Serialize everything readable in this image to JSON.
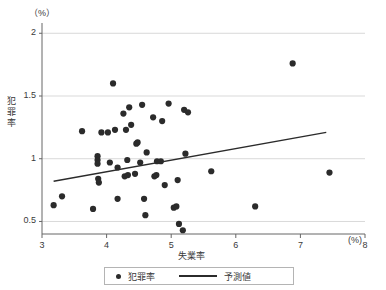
{
  "chart_data": {
    "type": "scatter",
    "title": "",
    "xlabel": "失業率",
    "ylabel": "犯罪率",
    "x_unit": "(%)",
    "y_unit": "（%）",
    "xlim": [
      3.0,
      8.0
    ],
    "ylim": [
      0.4,
      2.05
    ],
    "xticks": [
      3,
      4,
      5,
      6,
      7,
      8
    ],
    "xtick_labels": [
      "3",
      "4",
      "5",
      "6",
      "7",
      "8"
    ],
    "yticks": [
      0.5,
      1,
      1.5,
      2
    ],
    "ytick_labels": [
      "0.5",
      "1",
      "1.5",
      "2"
    ],
    "grid": "horizontal",
    "legend_position": "bottom",
    "marker_color": "#2b2b2b",
    "line_color": "#2b2b2b",
    "grid_color": "#d9d9d9",
    "axis_color": "#666666",
    "series": [
      {
        "name": "犯罪率",
        "type": "scatter",
        "points": [
          [
            3.18,
            0.63
          ],
          [
            3.31,
            0.7
          ],
          [
            3.62,
            1.22
          ],
          [
            3.79,
            0.6
          ],
          [
            3.86,
            1.02
          ],
          [
            3.86,
            0.99
          ],
          [
            3.86,
            0.96
          ],
          [
            3.87,
            0.84
          ],
          [
            3.88,
            0.81
          ],
          [
            3.92,
            1.21
          ],
          [
            4.02,
            1.21
          ],
          [
            4.05,
            0.97
          ],
          [
            4.1,
            1.6
          ],
          [
            4.13,
            1.23
          ],
          [
            4.17,
            0.93
          ],
          [
            4.17,
            0.68
          ],
          [
            4.26,
            1.36
          ],
          [
            4.28,
            0.86
          ],
          [
            4.3,
            1.23
          ],
          [
            4.32,
            0.99
          ],
          [
            4.33,
            0.87
          ],
          [
            4.35,
            1.41
          ],
          [
            4.38,
            1.27
          ],
          [
            4.44,
            0.88
          ],
          [
            4.46,
            1.12
          ],
          [
            4.48,
            1.13
          ],
          [
            4.52,
            0.97
          ],
          [
            4.55,
            1.43
          ],
          [
            4.58,
            0.68
          ],
          [
            4.6,
            0.55
          ],
          [
            4.62,
            1.05
          ],
          [
            4.72,
            1.33
          ],
          [
            4.74,
            0.86
          ],
          [
            4.77,
            0.87
          ],
          [
            4.78,
            0.98
          ],
          [
            4.84,
            0.98
          ],
          [
            4.86,
            1.3
          ],
          [
            4.9,
            0.79
          ],
          [
            4.96,
            1.44
          ],
          [
            5.04,
            0.61
          ],
          [
            5.08,
            0.62
          ],
          [
            5.1,
            0.83
          ],
          [
            5.12,
            0.48
          ],
          [
            5.18,
            0.43
          ],
          [
            5.2,
            1.39
          ],
          [
            5.22,
            1.04
          ],
          [
            5.26,
            1.37
          ],
          [
            5.62,
            0.9
          ],
          [
            6.3,
            0.62
          ],
          [
            6.88,
            1.76
          ],
          [
            7.45,
            0.89
          ]
        ]
      },
      {
        "name": "予測値",
        "type": "line",
        "points": [
          [
            3.18,
            0.82
          ],
          [
            7.4,
            1.21
          ]
        ]
      }
    ]
  },
  "legend": {
    "items": [
      {
        "label": "犯罪率",
        "marker": "dot"
      },
      {
        "label": "予測値",
        "marker": "line"
      }
    ]
  }
}
